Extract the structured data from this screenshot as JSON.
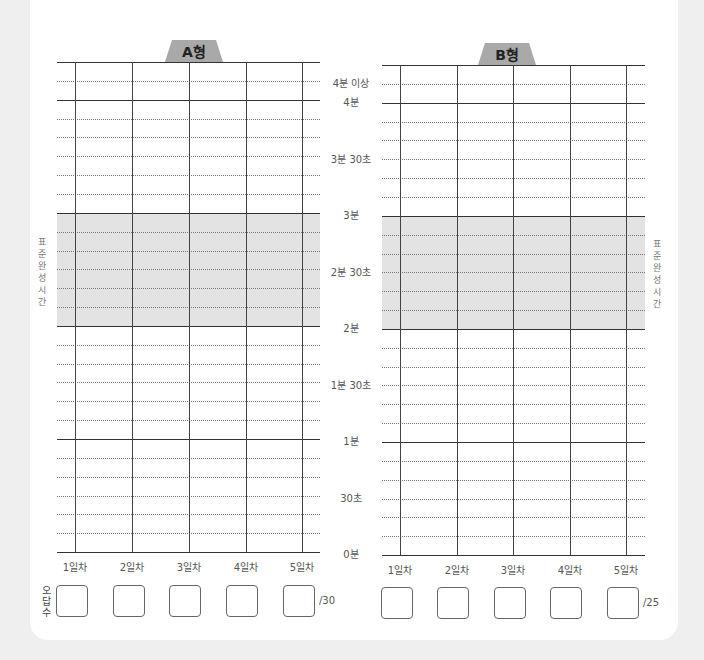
{
  "charts": [
    {
      "id": "A",
      "tab_label": "A형",
      "wrong_total": "/30"
    },
    {
      "id": "B",
      "tab_label": "B형",
      "wrong_total": "/25"
    }
  ],
  "y_axis_labels": [
    "4분 이상",
    "4분",
    "3분 30초",
    "3분",
    "2분 30초",
    "2분",
    "1분 30초",
    "1분",
    "30초",
    "0분"
  ],
  "x_axis_labels": [
    "1일차",
    "2일차",
    "3일차",
    "4일차",
    "5일차"
  ],
  "standard_time_label": "표준완성시간",
  "wrong_answers_label": "오답수",
  "colors": {
    "standard_band": "#e3e3e3",
    "tab": "#a9a9a9",
    "background": "#efefef"
  }
}
